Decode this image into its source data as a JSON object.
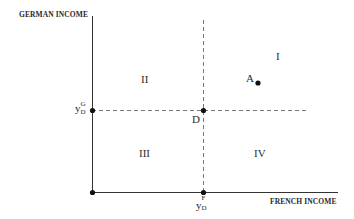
{
  "axes": {
    "y_label": "GERMAN INCOME",
    "x_label": "FRENCH INCOME"
  },
  "regions": {
    "I": "I",
    "II": "II",
    "III": "III",
    "IV": "IV"
  },
  "points": {
    "A": "A",
    "D": "D"
  },
  "ticks": {
    "y_tick": {
      "base": "y",
      "sub": "D",
      "sup": "G"
    },
    "x_tick": {
      "base": "y",
      "sub": "D",
      "sup": "F"
    }
  },
  "colors": {
    "line": "#333333",
    "dash": "#555555",
    "text": "#2a2a2a"
  }
}
